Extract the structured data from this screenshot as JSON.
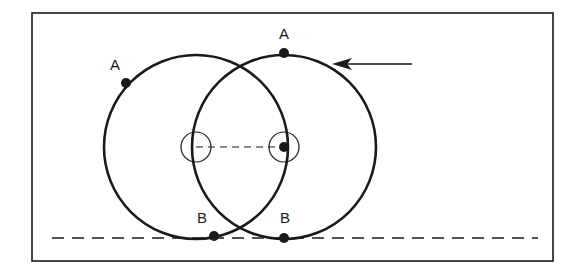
{
  "diagram": {
    "type": "rolling-circle-cycloid",
    "colors": {
      "stroke": "#1a1a1a",
      "background": "#ffffff"
    },
    "frame": {
      "x": 32,
      "y": 13,
      "width": 521,
      "height": 248
    },
    "baseline": {
      "y": 238,
      "x1": 52,
      "x2": 538,
      "style": "dashed"
    },
    "center_line": {
      "x1": 196,
      "x2": 284,
      "y": 147,
      "style": "dashed"
    },
    "circles": [
      {
        "id": "left",
        "cx": 196,
        "cy": 147,
        "r": 92,
        "hub_radius": 15,
        "point_A": {
          "x": 126,
          "y": 83,
          "label": "A",
          "label_x": 110,
          "label_y": 70
        },
        "point_B": {
          "x": 214,
          "y": 236,
          "label": "B",
          "label_x": 197,
          "label_y": 223
        }
      },
      {
        "id": "right",
        "cx": 284,
        "cy": 147,
        "r": 92,
        "hub_radius": 15,
        "point_A": {
          "x": 284,
          "y": 53,
          "label": "A",
          "label_x": 279,
          "label_y": 39
        },
        "point_B": {
          "x": 284,
          "y": 238,
          "label": "B",
          "label_x": 280,
          "label_y": 223
        }
      }
    ],
    "arrow": {
      "x1": 412,
      "y1": 64,
      "x2": 332,
      "y2": 64,
      "direction": "left"
    }
  }
}
